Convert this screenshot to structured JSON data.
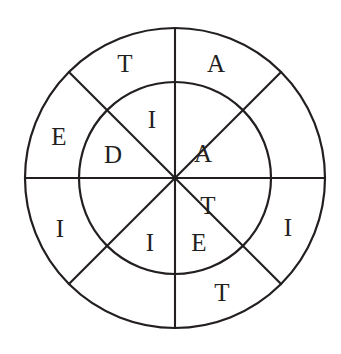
{
  "figure": {
    "background_color": "#ffffff",
    "stroke_color": "#231f20",
    "stroke_width": 2.1
  },
  "geometry": {
    "center_x": 175,
    "center_y": 178,
    "outer_radius": 150,
    "inner_radius": 96,
    "sector_count": 8,
    "diameter_angles_deg": [
      0,
      45,
      90,
      135
    ]
  },
  "chart_data": {
    "type": "diagram",
    "rings": [
      {
        "name": "outer-ring",
        "radius_inner": 96,
        "radius_outer": 150,
        "label_radius": 123,
        "sectors": [
          {
            "index": 0,
            "position": "north-northeast",
            "center_angle_deg": 67.5,
            "letter": "A"
          },
          {
            "index": 1,
            "position": "east-northeast",
            "center_angle_deg": 22.5,
            "letter": ""
          },
          {
            "index": 2,
            "position": "east-southeast",
            "center_angle_deg": -22.5,
            "letter": "I"
          },
          {
            "index": 3,
            "position": "south-southeast",
            "center_angle_deg": -67.5,
            "letter": "T"
          },
          {
            "index": 4,
            "position": "south-southwest",
            "center_angle_deg": -112.5,
            "letter": ""
          },
          {
            "index": 5,
            "position": "west-southwest",
            "center_angle_deg": -157.5,
            "letter": "I"
          },
          {
            "index": 6,
            "position": "west-northwest",
            "center_angle_deg": 157.5,
            "letter": "E"
          },
          {
            "index": 7,
            "position": "north-northwest",
            "center_angle_deg": 112.5,
            "letter": "T"
          }
        ]
      },
      {
        "name": "inner-ring",
        "radius_inner": 0,
        "radius_outer": 96,
        "label_radius": 62,
        "sectors": [
          {
            "index": 0,
            "position": "north-northeast",
            "center_angle_deg": 67.5,
            "letter": ""
          },
          {
            "index": 1,
            "position": "east-northeast",
            "center_angle_deg": 22.5,
            "letter": "A"
          },
          {
            "index": 2,
            "position": "east-southeast",
            "center_angle_deg": -22.5,
            "letter": "T"
          },
          {
            "index": 3,
            "position": "south-southeast",
            "center_angle_deg": -67.5,
            "letter": "E"
          },
          {
            "index": 4,
            "position": "south-southwest",
            "center_angle_deg": -112.5,
            "letter": "I"
          },
          {
            "index": 5,
            "position": "west-southwest",
            "center_angle_deg": -157.5,
            "letter": ""
          },
          {
            "index": 6,
            "position": "west-northwest",
            "center_angle_deg": 157.5,
            "letter": "D"
          },
          {
            "index": 7,
            "position": "north-northwest",
            "center_angle_deg": 112.5,
            "letter": "I"
          }
        ]
      }
    ],
    "letters_in_reading_order": [
      "T",
      "A",
      "I",
      "E",
      "D",
      "A",
      "I",
      "T",
      "I",
      "E",
      "I",
      "T"
    ]
  },
  "labels": {
    "outer_nnw": "T",
    "outer_nne": "A",
    "outer_ene": "",
    "outer_ese": "I",
    "outer_sse": "T",
    "outer_ssw": "",
    "outer_wsw": "I",
    "outer_wnw": "E",
    "inner_nnw": "I",
    "inner_nne": "",
    "inner_ene": "A",
    "inner_ese": "T",
    "inner_sse": "E",
    "inner_ssw": "I",
    "inner_wsw": "",
    "inner_wnw": "D"
  },
  "label_positions": {
    "outer_nnw": {
      "x": 125,
      "y": 66
    },
    "outer_nne": {
      "x": 216,
      "y": 66
    },
    "outer_ese": {
      "x": 288,
      "y": 230
    },
    "outer_sse": {
      "x": 222,
      "y": 295
    },
    "outer_wsw": {
      "x": 60,
      "y": 231
    },
    "outer_wnw": {
      "x": 59,
      "y": 139
    },
    "inner_nnw": {
      "x": 152,
      "y": 122
    },
    "inner_ene": {
      "x": 203,
      "y": 156
    },
    "inner_ese": {
      "x": 208,
      "y": 208
    },
    "inner_sse": {
      "x": 199,
      "y": 245
    },
    "inner_ssw": {
      "x": 150,
      "y": 245
    },
    "inner_wnw": {
      "x": 113,
      "y": 157
    }
  }
}
